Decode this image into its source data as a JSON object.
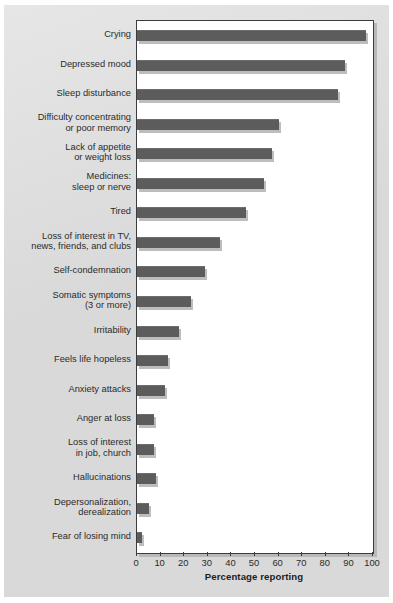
{
  "chart_data": {
    "type": "bar",
    "orientation": "horizontal",
    "title": "",
    "xlabel": "Percentage reporting",
    "ylabel": "",
    "xlim": [
      0,
      100
    ],
    "xticks": [
      "0",
      "10",
      "20",
      "30",
      "40",
      "50",
      "60",
      "70",
      "80",
      "90",
      "100"
    ],
    "grid": false,
    "legend": null,
    "bar_color": "#5c5c5c",
    "plot_background": "#ffffff",
    "figure_background": "#d9d9d9",
    "categories": [
      "Crying",
      "Depressed mood",
      "Sleep disturbance",
      "Difficulty concentrating\nor poor memory",
      "Lack of appetite\nor weight loss",
      "Medicines:\nsleep or nerve",
      "Tired",
      "Loss of interest in TV,\nnews, friends, and clubs",
      "Self-condemnation",
      "Somatic symptoms\n(3 or more)",
      "Irritability",
      "Feels life hopeless",
      "Anxiety attacks",
      "Anger at loss",
      "Loss of interest\nin job, church",
      "Hallucinations",
      "Depersonalization,\nderealization",
      "Fear of losing mind"
    ],
    "values": [
      97,
      88,
      85,
      60,
      57,
      54,
      46,
      35,
      29,
      23,
      18,
      13,
      12,
      7,
      7,
      8,
      5,
      2
    ]
  }
}
